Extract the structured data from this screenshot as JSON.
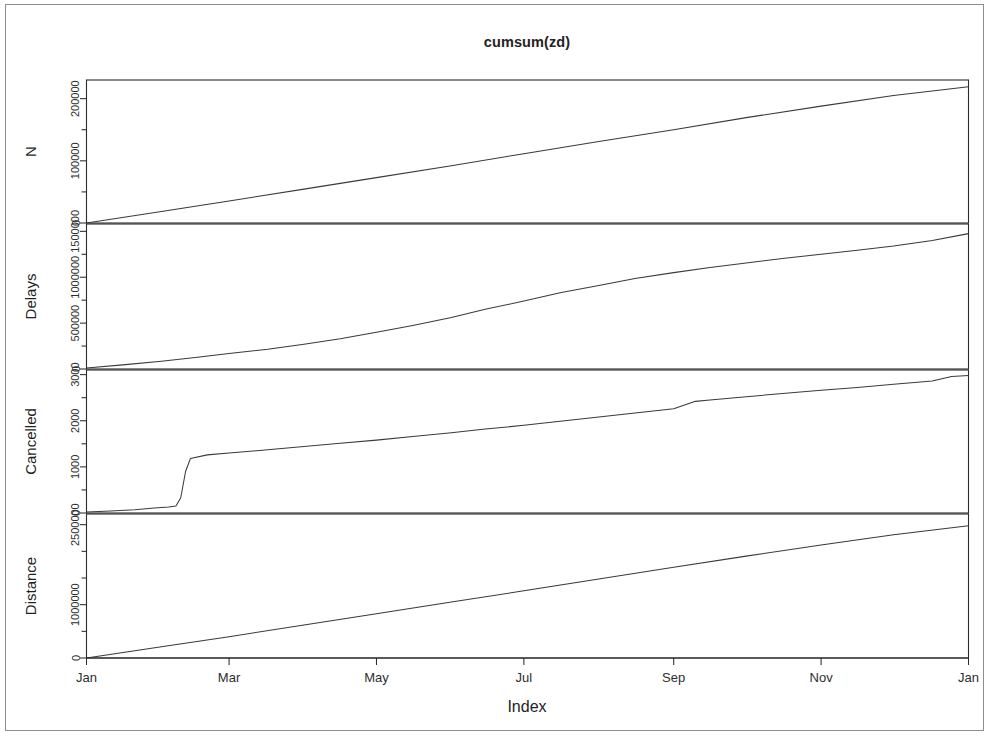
{
  "figure": {
    "title": "cumsum(zd)",
    "xlabel": "Index",
    "background": "#ffffff",
    "line_color": "#3a3a3a",
    "axis_color": "#2b2b2b"
  },
  "chart_data": {
    "type": "line",
    "title": "cumsum(zd)",
    "xlabel": "Index",
    "ylabel": "",
    "grid": false,
    "legend": null,
    "layout": "4 stacked panels sharing one x axis (R plot.ts multivariate cumulative sums)",
    "x_tick_labels": [
      "Jan",
      "Mar",
      "May",
      "Jul",
      "Sep",
      "Nov",
      "Jan"
    ],
    "x_tick_positions": [
      0,
      59,
      120,
      181,
      243,
      304,
      365
    ],
    "xlim": [
      0,
      365
    ],
    "panels": [
      {
        "name": "N",
        "ylabel": "N",
        "ylim": [
          0,
          230000
        ],
        "y_tick_labels": [
          "0",
          "100000",
          "200000"
        ],
        "y_tick_values": [
          0,
          100000,
          200000
        ],
        "minor_tick_values": [
          50000,
          150000
        ],
        "x": [
          0,
          31,
          59,
          90,
          120,
          151,
          181,
          212,
          243,
          273,
          304,
          334,
          365
        ],
        "values": [
          0,
          18500,
          35500,
          54500,
          73000,
          92000,
          111500,
          131000,
          150000,
          169500,
          188000,
          205000,
          219000
        ],
        "shape": "near-perfectly linear increase",
        "final_value": 219000
      },
      {
        "name": "Delays",
        "ylabel": "Delays",
        "ylim": [
          0,
          1580000
        ],
        "y_tick_labels": [
          "0",
          "500000",
          "1000000",
          "1500000"
        ],
        "y_tick_values": [
          0,
          500000,
          1000000,
          1500000
        ],
        "minor_tick_values": [
          250000,
          750000,
          1250000
        ],
        "x": [
          0,
          15,
          31,
          45,
          59,
          75,
          90,
          105,
          120,
          135,
          151,
          165,
          181,
          196,
          212,
          227,
          243,
          258,
          273,
          288,
          304,
          319,
          334,
          350,
          365
        ],
        "values": [
          10000,
          45000,
          85000,
          125000,
          170000,
          215000,
          270000,
          330000,
          400000,
          475000,
          560000,
          650000,
          740000,
          830000,
          910000,
          985000,
          1050000,
          1105000,
          1155000,
          1205000,
          1250000,
          1295000,
          1340000,
          1400000,
          1475000
        ],
        "shape": "S-shaped: moderate early growth, acceleration Apr-Jul, flattening after Sep",
        "final_value": 1475000
      },
      {
        "name": "Cancelled",
        "ylabel": "Cancelled",
        "ylim": [
          0,
          3100
        ],
        "y_tick_labels": [
          "0",
          "1000",
          "2000",
          "3000"
        ],
        "y_tick_values": [
          0,
          1000,
          2000,
          3000
        ],
        "minor_tick_values": [
          500,
          1500,
          2500
        ],
        "x": [
          0,
          10,
          20,
          28,
          34,
          37,
          39,
          41,
          43,
          50,
          59,
          75,
          90,
          105,
          120,
          135,
          151,
          165,
          181,
          196,
          212,
          227,
          243,
          252,
          258,
          273,
          288,
          304,
          319,
          334,
          350,
          358,
          365
        ],
        "values": [
          20,
          45,
          70,
          110,
          130,
          150,
          330,
          900,
          1180,
          1260,
          1300,
          1370,
          1440,
          1510,
          1580,
          1660,
          1740,
          1820,
          1900,
          1990,
          2080,
          2170,
          2260,
          2420,
          2450,
          2520,
          2590,
          2660,
          2720,
          2790,
          2860,
          2960,
          2980
        ],
        "shape": "flat start, abrupt vertical jump in early February (~day 40), then steady stepped climb",
        "final_value": 2980
      },
      {
        "name": "Distance",
        "ylabel": "Distance",
        "ylim": [
          0,
          270000000
        ],
        "y_tick_labels": [
          "0",
          "1000000",
          "2500000"
        ],
        "y_tick_values": [
          0,
          100000000,
          250000000
        ],
        "minor_tick_values": [
          50000000,
          150000000,
          200000000
        ],
        "x": [
          0,
          31,
          59,
          90,
          120,
          151,
          181,
          212,
          243,
          273,
          304,
          334,
          365
        ],
        "values": [
          0,
          21000000,
          40000000,
          62000000,
          83000000,
          105000000,
          126000000,
          148000000,
          170000000,
          191000000,
          212000000,
          231000000,
          248000000
        ],
        "shape": "perfectly linear increase",
        "final_value": 248000000
      }
    ]
  }
}
